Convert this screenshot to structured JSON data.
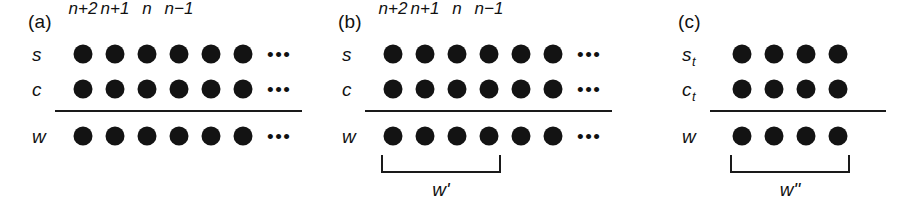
{
  "figure": {
    "background_color": "#ffffff",
    "ink_color": "#131313",
    "panels": [
      {
        "id": "a",
        "letter": "(a)",
        "column_headers": [
          "n+2",
          "n+1",
          "n",
          "n−1"
        ],
        "rows": [
          {
            "label": "s",
            "subscript": "",
            "dot_count": 6,
            "ellipsis": "•••"
          },
          {
            "label": "c",
            "subscript": "",
            "dot_count": 6,
            "ellipsis": "•••"
          },
          {
            "label": "w",
            "subscript": "",
            "dot_count": 6,
            "ellipsis": "•••"
          }
        ],
        "has_separator": true,
        "bracket": null,
        "bracket_label": null
      },
      {
        "id": "b",
        "letter": "(b)",
        "column_headers": [
          "n+2",
          "n+1",
          "n",
          "n−1"
        ],
        "rows": [
          {
            "label": "s",
            "subscript": "",
            "dot_count": 6,
            "ellipsis": "•••"
          },
          {
            "label": "c",
            "subscript": "",
            "dot_count": 6,
            "ellipsis": "•••"
          },
          {
            "label": "w",
            "subscript": "",
            "dot_count": 6,
            "ellipsis": "•••"
          }
        ],
        "has_separator": true,
        "bracket": {
          "spans_dots": 4
        },
        "bracket_label": "w'"
      },
      {
        "id": "c",
        "letter": "(c)",
        "column_headers": [],
        "rows": [
          {
            "label": "s",
            "subscript": "t",
            "dot_count": 4,
            "ellipsis": ""
          },
          {
            "label": "c",
            "subscript": "t",
            "dot_count": 4,
            "ellipsis": ""
          },
          {
            "label": "w",
            "subscript": "",
            "dot_count": 4,
            "ellipsis": ""
          }
        ],
        "has_separator": true,
        "bracket": {
          "spans_dots": 4
        },
        "bracket_label": "w\""
      }
    ]
  }
}
